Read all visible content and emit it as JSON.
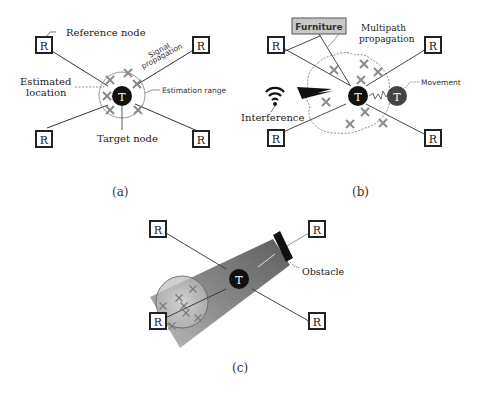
{
  "panel_a": {
    "caption": "(a)",
    "labels": {
      "reference_node": "Reference node",
      "signal_propagation_1": "Signal",
      "signal_propagation_2": "propagation",
      "estimated_location_1": "Estimated",
      "estimated_location_2": "location",
      "estimation_range": "Estimation range",
      "target_node": "Target node"
    },
    "node_r": "R",
    "node_t": "T"
  },
  "panel_b": {
    "caption": "(b)",
    "labels": {
      "furniture": "Furniture",
      "multipath_1": "Multipath",
      "multipath_2": "propagation",
      "interference": "Interference",
      "movement": "Movement"
    },
    "node_r": "R",
    "node_t": "T"
  },
  "panel_c": {
    "caption": "(c)",
    "labels": {
      "obstacle": "Obstacle"
    },
    "node_r": "R",
    "node_t": "T"
  },
  "colors": {
    "node_fill": "#111111",
    "moved_node_fill": "#444444",
    "furniture_fill": "#c8c8c8",
    "cross": "#888888",
    "shadow_dark": "#6f6f6f",
    "shadow_light": "#d8d8d8"
  }
}
